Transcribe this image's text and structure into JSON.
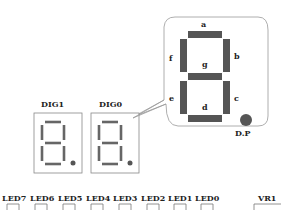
{
  "callout": {
    "segments": {
      "a": "a",
      "b": "b",
      "c": "c",
      "d": "d",
      "e": "e",
      "f": "f",
      "g": "g",
      "dp": "D.P"
    }
  },
  "digits": [
    {
      "label": "DIG1"
    },
    {
      "label": "DIG0"
    }
  ],
  "leds": [
    {
      "label": "LED7"
    },
    {
      "label": "LED6"
    },
    {
      "label": "LED5"
    },
    {
      "label": "LED4"
    },
    {
      "label": "LED3"
    },
    {
      "label": "LED2"
    },
    {
      "label": "LED1"
    },
    {
      "label": "LED0"
    }
  ],
  "vr": {
    "label": "VR1"
  },
  "colors": {
    "segment": "#555555",
    "outline": "#888888",
    "text": "#222222"
  }
}
